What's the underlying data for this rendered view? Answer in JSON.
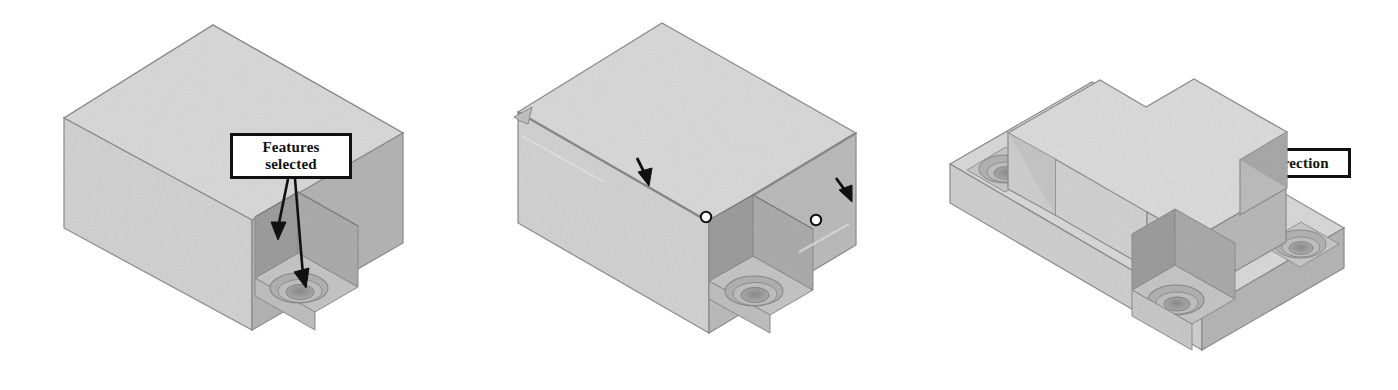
{
  "document": {
    "title": "Counterbore feature pattern - isometric CAD views",
    "background_color": "#ffffff",
    "views": 3
  },
  "palette": {
    "top_face": "#d9d9d9",
    "front_face": "#d2d2d2",
    "right_face": "#b4b4b4",
    "pocket_wall_dark": "#9a9a9a",
    "pocket_wall_mid": "#a8a8a8",
    "pocket_floor": "#c2c2c2",
    "hole_counterbore": "#b0b0b0",
    "hole_bore": "#8e8e8e",
    "edge_line": "#7a7a7a",
    "callout_border": "#111111",
    "callout_fill": "#ffffff",
    "arrow_color": "#111111",
    "vertex_marker_stroke": "#111111",
    "vertex_marker_fill": "#ffffff"
  },
  "figures": [
    {
      "id": "figure-1",
      "name": "block-with-single-counterbore-pocket",
      "description": "Rectangular block with a corner pocket containing one counterbored hole",
      "callouts": [
        {
          "id": "callout-features",
          "name": "features-selected-callout",
          "label": "Features\nselected",
          "line1": "Features",
          "line2": "selected",
          "arrows": 2
        }
      ],
      "vertex_markers": 0
    },
    {
      "id": "figure-2",
      "name": "block-with-direction-callouts",
      "description": "Same block with two linear pattern direction edges selected and two vertex markers",
      "callouts": [
        {
          "id": "callout-direction1",
          "name": "direction-1-callout",
          "label": "Direction 1",
          "arrows": 1
        },
        {
          "id": "callout-direction2",
          "name": "direction-2-callout",
          "label": "Direction",
          "arrows": 1
        }
      ],
      "vertex_markers": 2
    },
    {
      "id": "figure-3",
      "name": "block-with-patterned-counterbores",
      "description": "Resulting patterned part with a cross-shaped raised boss and three counterbored pockets",
      "callouts": [],
      "vertex_markers": 0
    }
  ],
  "callouts": {
    "features_selected": {
      "line1": "Features",
      "line2": "selected",
      "full": "Features selected"
    },
    "direction_1": {
      "text": "Direction 1"
    },
    "direction_2": {
      "text": "Direction"
    }
  }
}
